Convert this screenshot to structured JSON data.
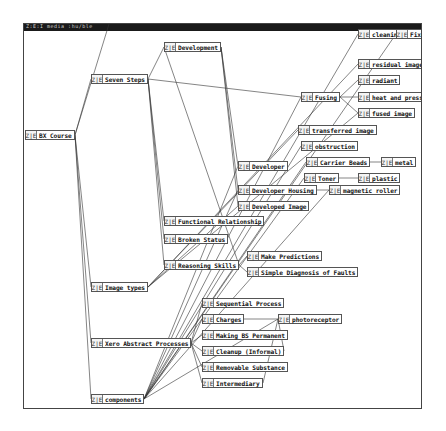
{
  "window": {
    "title": "Z:E:I  media :hu/ble"
  },
  "node_icon": "Z|E",
  "nodes": [
    {
      "id": "bx-course",
      "label": "BX Course",
      "x": 24,
      "y": 129
    },
    {
      "id": "seven-steps",
      "label": "Seven Steps",
      "x": 90,
      "y": 73
    },
    {
      "id": "development",
      "label": "Development",
      "x": 163,
      "y": 41
    },
    {
      "id": "image-types",
      "label": "Image types",
      "x": 90,
      "y": 281
    },
    {
      "id": "xero-abstract-processes",
      "label": "Xero Abstract Processes",
      "x": 90,
      "y": 337
    },
    {
      "id": "components",
      "label": "components",
      "x": 90,
      "y": 393
    },
    {
      "id": "functional-relationship",
      "label": "Functional Relationship",
      "x": 163,
      "y": 215
    },
    {
      "id": "broken-status",
      "label": "Broken Status",
      "x": 163,
      "y": 233
    },
    {
      "id": "reasoning-skills",
      "label": "Reasoning Skills",
      "x": 163,
      "y": 259
    },
    {
      "id": "developer",
      "label": "Developer",
      "x": 237,
      "y": 160
    },
    {
      "id": "developer-housing",
      "label": "Developer Housing",
      "x": 237,
      "y": 184
    },
    {
      "id": "developed-image",
      "label": "Developed Image",
      "x": 237,
      "y": 200
    },
    {
      "id": "fusing",
      "label": "Fusing",
      "x": 300,
      "y": 91
    },
    {
      "id": "transferred-image",
      "label": "transferred image",
      "x": 297,
      "y": 124
    },
    {
      "id": "obstruction",
      "label": "obstruction",
      "x": 300,
      "y": 140
    },
    {
      "id": "carrier-beads",
      "label": "Carrier Beads",
      "x": 305,
      "y": 156
    },
    {
      "id": "toner",
      "label": "Toner",
      "x": 303,
      "y": 172
    },
    {
      "id": "metal",
      "label": "metal",
      "x": 380,
      "y": 156
    },
    {
      "id": "plastic",
      "label": "plastic",
      "x": 357,
      "y": 172
    },
    {
      "id": "magnetic-roller",
      "label": "magnetic roller",
      "x": 328,
      "y": 184
    },
    {
      "id": "residual-image",
      "label": "residual image",
      "x": 357,
      "y": 58
    },
    {
      "id": "radiant",
      "label": "radiant",
      "x": 357,
      "y": 74
    },
    {
      "id": "heat-and-pressure",
      "label": "heat and pressure",
      "x": 357,
      "y": 91
    },
    {
      "id": "fused-image",
      "label": "fused image",
      "x": 357,
      "y": 107
    },
    {
      "id": "cleaning",
      "label": "cleaning",
      "x": 357,
      "y": 28
    },
    {
      "id": "fixer",
      "label": "Fixer",
      "x": 395,
      "y": 28
    },
    {
      "id": "make-predictions",
      "label": "Make Predictions",
      "x": 246,
      "y": 250
    },
    {
      "id": "simple-diagnosis",
      "label": "Simple Diagnosis of Faults",
      "x": 246,
      "y": 266
    },
    {
      "id": "sequential-process",
      "label": "Sequential Process",
      "x": 201,
      "y": 297
    },
    {
      "id": "charges",
      "label": "Charges",
      "x": 201,
      "y": 313
    },
    {
      "id": "photoreceptor",
      "label": "photoreceptor",
      "x": 277,
      "y": 313
    },
    {
      "id": "making-bs-permanent",
      "label": "Making BS Permanent",
      "x": 201,
      "y": 329
    },
    {
      "id": "cleanup-informal",
      "label": "Cleanup (Informal)",
      "x": 201,
      "y": 345
    },
    {
      "id": "removable-substance",
      "label": "Removable Substance",
      "x": 201,
      "y": 361
    },
    {
      "id": "intermediary",
      "label": "Intermediary",
      "x": 201,
      "y": 377
    }
  ],
  "edges": [
    [
      "bx-course",
      "seven-steps"
    ],
    [
      "bx-course",
      "image-types"
    ],
    [
      "bx-course",
      "xero-abstract-processes"
    ],
    [
      "bx-course",
      "components"
    ],
    [
      "bx-course",
      "window-top"
    ],
    [
      "seven-steps",
      "development"
    ],
    [
      "seven-steps",
      "functional-relationship"
    ],
    [
      "seven-steps",
      "broken-status"
    ],
    [
      "seven-steps",
      "reasoning-skills"
    ],
    [
      "seven-steps",
      "fusing"
    ],
    [
      "development",
      "developer"
    ],
    [
      "development",
      "developer-housing"
    ],
    [
      "development",
      "developed-image"
    ],
    [
      "image-types",
      "residual-image"
    ],
    [
      "image-types",
      "transferred-image"
    ],
    [
      "image-types",
      "fused-image"
    ],
    [
      "image-types",
      "developed-image"
    ],
    [
      "fusing",
      "heat-and-pressure"
    ],
    [
      "fusing",
      "fused-image"
    ],
    [
      "fusing",
      "radiant"
    ],
    [
      "carrier-beads",
      "metal"
    ],
    [
      "toner",
      "plastic"
    ],
    [
      "developer-housing",
      "magnetic-roller"
    ],
    [
      "reasoning-skills",
      "make-predictions"
    ],
    [
      "reasoning-skills",
      "simple-diagnosis"
    ],
    [
      "reasoning-skills",
      "development"
    ],
    [
      "xero-abstract-processes",
      "sequential-process"
    ],
    [
      "xero-abstract-processes",
      "charges"
    ],
    [
      "xero-abstract-processes",
      "making-bs-permanent"
    ],
    [
      "xero-abstract-processes",
      "cleanup-informal"
    ],
    [
      "xero-abstract-processes",
      "removable-substance"
    ],
    [
      "xero-abstract-processes",
      "intermediary"
    ],
    [
      "components",
      "developer"
    ],
    [
      "components",
      "toner"
    ],
    [
      "components",
      "carrier-beads"
    ],
    [
      "components",
      "photoreceptor"
    ],
    [
      "components",
      "developer-housing"
    ],
    [
      "components",
      "fusing"
    ],
    [
      "components",
      "magnetic-roller"
    ],
    [
      "components",
      "obstruction"
    ],
    [
      "components",
      "cleaning"
    ],
    [
      "components",
      "fixer"
    ],
    [
      "charges",
      "photoreceptor"
    ],
    [
      "intermediary",
      "photoreceptor"
    ],
    [
      "cleanup-informal",
      "photoreceptor"
    ]
  ]
}
